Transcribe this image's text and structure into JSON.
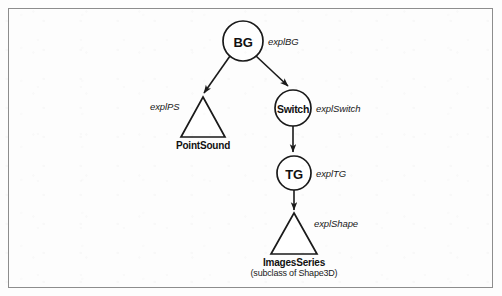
{
  "figure": {
    "background_color": "#fdfdfd",
    "border_color": "#8d8d8d",
    "stroke_color": "#1a1a1a"
  },
  "nodes": [
    {
      "id": "bg",
      "label": "BG",
      "shape": "circle",
      "cx": 243,
      "cy": 41,
      "r": 20,
      "exp_label": "explBG",
      "exp_x": 268,
      "exp_y": 36,
      "caption": "",
      "subcaption": ""
    },
    {
      "id": "pointsound",
      "label": "",
      "shape": "triangle",
      "cx": 203,
      "cy": 117,
      "apex_y": 97,
      "base_y": 137,
      "half_width": 22,
      "exp_label": "explPS",
      "exp_x": 150,
      "exp_y": 101,
      "caption": "PointSound",
      "caption_y": 140,
      "subcaption": ""
    },
    {
      "id": "switch",
      "label": "Switch",
      "shape": "circle",
      "cx": 293,
      "cy": 108,
      "r": 18,
      "exp_label": "explSwitch",
      "exp_x": 316,
      "exp_y": 103,
      "caption": "",
      "subcaption": ""
    },
    {
      "id": "tg",
      "label": "TG",
      "shape": "circle",
      "cx": 294,
      "cy": 173,
      "r": 17,
      "exp_label": "explTG",
      "exp_x": 316,
      "exp_y": 168,
      "caption": "",
      "subcaption": ""
    },
    {
      "id": "imagesseries",
      "label": "",
      "shape": "triangle",
      "cx": 294,
      "cy": 234,
      "apex_y": 213,
      "base_y": 254,
      "half_width": 23,
      "exp_label": "explShape",
      "exp_x": 314,
      "exp_y": 218,
      "caption": "ImagesSeries",
      "caption_y": 257,
      "subcaption": "(subclass of Shape3D)",
      "subcaption_y": 268
    }
  ],
  "edges": [
    {
      "id": "bg-to-pointsound",
      "from": "bg",
      "to": "pointsound",
      "x1": 230,
      "y1": 56,
      "x2": 204,
      "y2": 93,
      "arrow": true
    },
    {
      "id": "bg-to-switch",
      "from": "bg",
      "to": "switch",
      "x1": 256,
      "y1": 56,
      "x2": 288,
      "y2": 86,
      "arrow": true
    },
    {
      "id": "switch-to-tg",
      "from": "switch",
      "to": "tg",
      "x1": 293,
      "y1": 126,
      "x2": 293,
      "y2": 152,
      "arrow": true
    },
    {
      "id": "tg-to-imagesseries",
      "from": "tg",
      "to": "imagesseries",
      "x1": 294,
      "y1": 190,
      "x2": 294,
      "y2": 210,
      "arrow": true
    }
  ]
}
